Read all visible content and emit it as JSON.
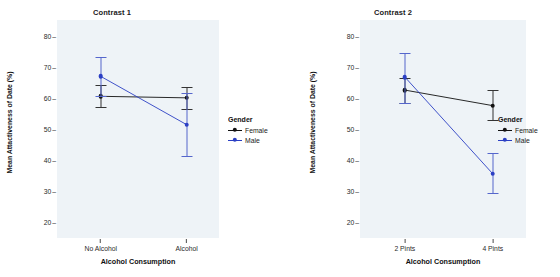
{
  "figure": {
    "ytitle": "Mean Attactiveness of Date (%)",
    "xtitle": "Alcohol Consumption",
    "legend_title": "Gender",
    "yticks": [
      "80",
      "70",
      "60",
      "50",
      "40",
      "30",
      "20"
    ],
    "colors": {
      "female": "#111111",
      "male": "#2b3fc4",
      "panel": "#eef3f7"
    }
  },
  "panels": [
    {
      "title": "Contrast 1",
      "categories": [
        "No Alcohol",
        "Alcohol"
      ],
      "legend": {
        "title": "Gender",
        "items": [
          "Female",
          "Male"
        ]
      }
    },
    {
      "title": "Contrast 2",
      "categories": [
        "2 Pints",
        "4 Pints"
      ],
      "legend": {
        "title": "Gender",
        "items": [
          "Female",
          "Male"
        ]
      }
    }
  ],
  "chart_data": [
    {
      "type": "line",
      "title": "Contrast 1",
      "xlabel": "Alcohol Consumption",
      "ylabel": "Mean Attactiveness of Date (%)",
      "categories": [
        "No Alcohol",
        "Alcohol"
      ],
      "ylim": [
        15,
        85
      ],
      "yticks": [
        20,
        30,
        40,
        50,
        60,
        70,
        80
      ],
      "grid": false,
      "legend": {
        "title": "Gender",
        "position": "right"
      },
      "series": [
        {
          "name": "Female",
          "color": "#111111",
          "values": [
            60.5,
            60.0
          ],
          "error_low": [
            57.0,
            56.5
          ],
          "error_high": [
            64.0,
            63.5
          ]
        },
        {
          "name": "Male",
          "color": "#2b3fc4",
          "values": [
            66.9,
            51.4
          ],
          "error_low": [
            60.5,
            41.3
          ],
          "error_high": [
            73.1,
            61.6
          ]
        }
      ]
    },
    {
      "type": "line",
      "title": "Contrast 2",
      "xlabel": "Alcohol Consumption",
      "ylabel": "Mean Attactiveness of Date (%)",
      "categories": [
        "2 Pints",
        "4 Pints"
      ],
      "ylim": [
        15,
        85
      ],
      "yticks": [
        20,
        30,
        40,
        50,
        60,
        70,
        80
      ],
      "grid": false,
      "legend": {
        "title": "Gender",
        "position": "right"
      },
      "series": [
        {
          "name": "Female",
          "color": "#111111",
          "values": [
            62.5,
            57.5
          ],
          "error_low": [
            58.3,
            52.9
          ],
          "error_high": [
            66.5,
            62.4
          ]
        },
        {
          "name": "Male",
          "color": "#2b3fc4",
          "values": [
            66.7,
            35.6
          ],
          "error_low": [
            58.5,
            29.3
          ],
          "error_high": [
            74.4,
            42.3
          ]
        }
      ]
    }
  ]
}
